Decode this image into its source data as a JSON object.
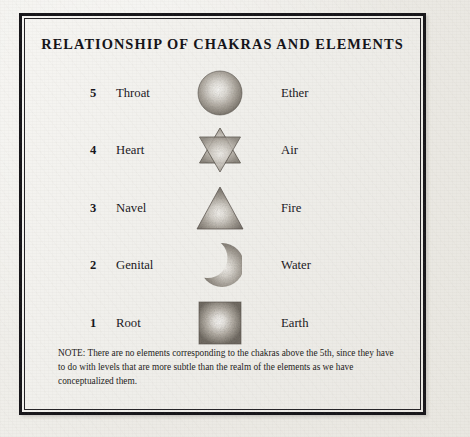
{
  "document": {
    "title": "RELATIONSHIP OF CHAKRAS AND ELEMENTS",
    "rows": [
      {
        "number": "5",
        "chakra": "Throat",
        "element": "Ether",
        "symbol": "sphere-icon"
      },
      {
        "number": "4",
        "chakra": "Heart",
        "element": "Air",
        "symbol": "hexagram-icon"
      },
      {
        "number": "3",
        "chakra": "Navel",
        "element": "Fire",
        "symbol": "triangle-icon"
      },
      {
        "number": "2",
        "chakra": "Genital",
        "element": "Water",
        "symbol": "crescent-icon"
      },
      {
        "number": "1",
        "chakra": "Root",
        "element": "Earth",
        "symbol": "square-icon"
      }
    ],
    "note": {
      "label": "NOTE:",
      "text": "There are no elements corresponding to the chakras above the 5th, since they have to do with levels that are more subtle than the realm of the elements as we have conceptualized them.",
      "full": "NOTE: There are no elements corresponding to the chakras above the 5th, since they have to do with levels that are more subtle than the realm of the elements as we have conceptualized them."
    }
  },
  "colors": {
    "ink": "#16151a",
    "paper": "#efeeea",
    "frame": "#17161a",
    "symbol_dark": "#6f6a64",
    "symbol_light": "#f3f1ec"
  }
}
